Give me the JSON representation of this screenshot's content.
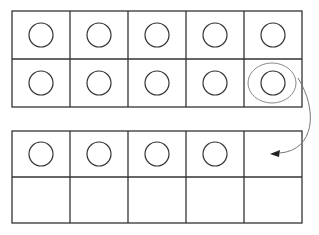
{
  "diagram": {
    "stroke_color": "#333333",
    "highlight_color": "#8a8a8a",
    "frames": [
      {
        "name": "ten-frame-top",
        "rows": 2,
        "cols": 5,
        "counters": [
          [
            true,
            true,
            true,
            true,
            true
          ],
          [
            true,
            true,
            true,
            true,
            true
          ]
        ]
      },
      {
        "name": "ten-frame-bottom",
        "rows": 2,
        "cols": 5,
        "counters": [
          [
            true,
            true,
            true,
            true,
            false
          ],
          [
            false,
            false,
            false,
            false,
            false
          ]
        ]
      }
    ],
    "arrow": {
      "from": "top frame row 2 col 5 (circled counter)",
      "to": "bottom frame row 1 col 5 (empty cell)"
    }
  }
}
